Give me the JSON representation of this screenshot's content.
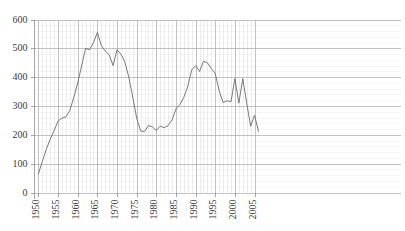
{
  "chart_data": {
    "type": "line",
    "title": "",
    "subtitle": "",
    "xlabel": "",
    "ylabel": "",
    "xlim": [
      1949,
      2006
    ],
    "ylim": [
      0,
      600
    ],
    "grid": true,
    "legend": null,
    "legend_position": "none",
    "y_ticks": [
      0,
      100,
      200,
      300,
      400,
      500,
      600
    ],
    "y_tick_labels": [
      "0",
      "100",
      "200",
      "300",
      "400",
      "500",
      "600"
    ],
    "x_ticks": [
      1950,
      1955,
      1960,
      1965,
      1970,
      1975,
      1980,
      1985,
      1990,
      1995,
      2000,
      2005
    ],
    "x_tick_labels": [
      "1950",
      "1955",
      "1960",
      "1965",
      "1970",
      "1975",
      "1980",
      "1985",
      "1990",
      "1995",
      "2000",
      "2005"
    ],
    "x_minor_step": 1,
    "series_color": "#6b6b6b",
    "x": [
      1950,
      1951,
      1952,
      1953,
      1954,
      1955,
      1956,
      1957,
      1958,
      1959,
      1960,
      1961,
      1962,
      1963,
      1964,
      1965,
      1966,
      1967,
      1968,
      1969,
      1970,
      1971,
      1972,
      1973,
      1974,
      1975,
      1976,
      1977,
      1978,
      1979,
      1980,
      1981,
      1982,
      1983,
      1984,
      1985,
      1986,
      1987,
      1988,
      1989,
      1990,
      1991,
      1992,
      1993,
      1994,
      1995,
      1996,
      1997,
      1998,
      1999,
      2000,
      2001,
      2002,
      2003,
      2004,
      2005,
      2006
    ],
    "values": [
      65,
      108,
      150,
      185,
      215,
      248,
      258,
      262,
      285,
      330,
      380,
      440,
      500,
      495,
      520,
      555,
      510,
      490,
      478,
      440,
      495,
      480,
      452,
      400,
      330,
      258,
      213,
      212,
      232,
      228,
      215,
      230,
      225,
      232,
      252,
      290,
      305,
      330,
      368,
      425,
      440,
      420,
      455,
      450,
      430,
      412,
      352,
      312,
      318,
      315,
      395,
      310,
      395,
      310,
      230,
      268,
      212
    ]
  }
}
